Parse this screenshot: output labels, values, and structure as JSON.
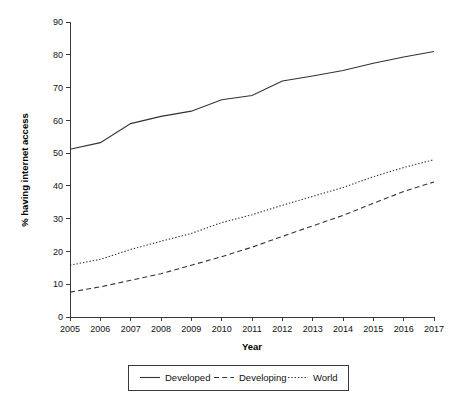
{
  "chart_data": {
    "type": "line",
    "title": "",
    "xlabel": "Year",
    "ylabel": "% having internet access",
    "x": [
      2005,
      2006,
      2007,
      2008,
      2009,
      2010,
      2011,
      2012,
      2013,
      2014,
      2015,
      2016,
      2017
    ],
    "categories": [
      "2005",
      "2006",
      "2007",
      "2008",
      "2009",
      "2010",
      "2011",
      "2012",
      "2013",
      "2014",
      "2015",
      "2016",
      "2017"
    ],
    "xlim": [
      2005,
      2017
    ],
    "ylim": [
      0,
      90
    ],
    "yticks": [
      0,
      10,
      20,
      30,
      40,
      50,
      60,
      70,
      80,
      90
    ],
    "ytick_labels": [
      "0",
      "10",
      "20",
      "30",
      "40",
      "50",
      "60",
      "70",
      "80",
      "90"
    ],
    "grid": false,
    "legend_position": "bottom",
    "series": [
      {
        "name": "Developed",
        "style": "solid",
        "color": "#333333",
        "values": [
          51.2,
          53.2,
          59.0,
          61.2,
          62.8,
          66.3,
          67.6,
          72.0,
          73.5,
          75.2,
          77.4,
          79.3,
          81.0
        ]
      },
      {
        "name": "Developing",
        "style": "dashed",
        "color": "#333333",
        "values": [
          7.6,
          9.2,
          11.2,
          13.2,
          15.8,
          18.4,
          21.3,
          24.6,
          27.8,
          31.0,
          34.7,
          38.3,
          41.2
        ]
      },
      {
        "name": "World",
        "style": "dotted",
        "color": "#333333",
        "values": [
          15.8,
          17.6,
          20.6,
          23.1,
          25.5,
          28.8,
          31.2,
          34.1,
          36.8,
          39.5,
          42.8,
          45.6,
          48.0
        ]
      }
    ]
  },
  "legend": {
    "items": [
      {
        "label": "Developed"
      },
      {
        "label": "Developing"
      },
      {
        "label": "World"
      }
    ]
  }
}
